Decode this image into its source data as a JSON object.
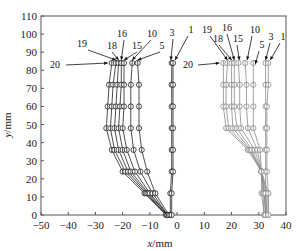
{
  "chart_data": {
    "type": "line",
    "title": "",
    "xlabel": "x/mm",
    "ylabel": "y/mm",
    "xlim": [
      -50,
      40
    ],
    "ylim": [
      0,
      110
    ],
    "xticks": [
      -50,
      -40,
      -30,
      -20,
      -10,
      0,
      10,
      20,
      30,
      40
    ],
    "yticks": [
      0,
      10,
      20,
      30,
      40,
      50,
      60,
      70,
      80,
      90,
      100,
      110
    ],
    "grid": false,
    "legend": "none (curves labelled by arrow annotations)",
    "y_levels": [
      0,
      12,
      24,
      36,
      48,
      60,
      72,
      84
    ],
    "groups": [
      {
        "name": "left group",
        "color": "#222222",
        "series": [
          {
            "name": "20",
            "x": [
              -4,
              -12,
              -20,
              -24,
              -26,
              -25.5,
              -25,
              -24
            ]
          },
          {
            "name": "19",
            "x": [
              -4,
              -11.5,
              -19,
              -23,
              -24.5,
              -24,
              -23.5,
              -22.5
            ]
          },
          {
            "name": "18",
            "x": [
              -4,
              -11,
              -18,
              -21.5,
              -23,
              -22.5,
              -22,
              -21.5
            ]
          },
          {
            "name": "16",
            "x": [
              -3.5,
              -10.5,
              -17,
              -20,
              -21.5,
              -21,
              -20.5,
              -20.5
            ]
          },
          {
            "name": "15",
            "x": [
              -3.5,
              -10,
              -15.5,
              -18.5,
              -20,
              -19.5,
              -19.5,
              -19.5
            ]
          },
          {
            "name": "10",
            "x": [
              -3.5,
              -9,
              -13.5,
              -16,
              -17,
              -17,
              -17,
              -16.5
            ]
          },
          {
            "name": "5",
            "x": [
              -3,
              -8,
              -11,
              -13,
              -14,
              -14,
              -14,
              -14.5
            ]
          },
          {
            "name": "3",
            "x": [
              -2.5,
              -2.5,
              -2,
              -2,
              -2,
              -2,
              -2,
              -2
            ]
          },
          {
            "name": "1",
            "x": [
              -2,
              -2,
              -1.5,
              -1.5,
              -1.5,
              -1.5,
              -1.5,
              -1.5
            ]
          }
        ]
      },
      {
        "name": "right group",
        "color": "#8a8a8a",
        "series": [
          {
            "name": "20",
            "x": [
              32,
              31,
              31,
              26,
              18,
              17,
              17,
              17
            ]
          },
          {
            "name": "19",
            "x": [
              32,
              31.5,
              31,
              26.5,
              19,
              18,
              18,
              18.5
            ]
          },
          {
            "name": "18",
            "x": [
              32.5,
              32,
              31,
              27,
              20.5,
              20,
              20,
              20
            ]
          },
          {
            "name": "16",
            "x": [
              32.5,
              32,
              31,
              27.5,
              22,
              21,
              21,
              21
            ]
          },
          {
            "name": "15",
            "x": [
              33,
              32.5,
              31,
              28.5,
              23.5,
              23,
              23,
              22.5
            ]
          },
          {
            "name": "10",
            "x": [
              33,
              33,
              31,
              29.5,
              26,
              25.5,
              25.5,
              25
            ]
          },
          {
            "name": "5",
            "x": [
              33.5,
              33.5,
              31,
              30.5,
              28,
              28,
              28,
              28
            ]
          },
          {
            "name": "3",
            "x": [
              32.5,
              32.5,
              32.5,
              32.5,
              32.5,
              32.5,
              32.5,
              32.5
            ]
          },
          {
            "name": "1",
            "x": [
              33.5,
              33.5,
              33,
              33,
              33,
              33,
              33.5,
              33.5
            ]
          }
        ]
      }
    ],
    "annotations": {
      "left": [
        "20",
        "19",
        "18",
        "16",
        "15",
        "10",
        "5",
        "3",
        "1"
      ],
      "right": [
        "20",
        "19",
        "18",
        "16",
        "15",
        "10",
        "5",
        "3",
        "1"
      ]
    }
  }
}
